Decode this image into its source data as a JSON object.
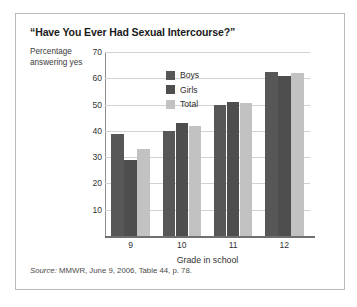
{
  "figure": {
    "title": "“Have You Ever Had Sexual Intercourse?”",
    "source_prefix": "Source:",
    "source_text": " MMWR, June 9, 2006, Table 44, p. 78."
  },
  "chart_data": {
    "type": "bar",
    "title": "“Have You Ever Had Sexual Intercourse?”",
    "xlabel": "Grade in school",
    "ylabel": "Percentage answering yes",
    "categories": [
      "9",
      "10",
      "11",
      "12"
    ],
    "series": [
      {
        "name": "Boys",
        "color": "#575757",
        "values": [
          39,
          40,
          50,
          62.5
        ]
      },
      {
        "name": "Girls",
        "color": "#4e4e4e",
        "values": [
          29,
          43,
          51,
          61
        ]
      },
      {
        "name": "Total",
        "color": "#c2c2c2",
        "values": [
          33,
          42,
          50.5,
          62
        ]
      }
    ],
    "ylim": [
      0,
      70
    ],
    "yticks": [
      70,
      60,
      50,
      40,
      30,
      20,
      10
    ],
    "grid": "horizontal",
    "legend_position": "inside-top-center"
  }
}
